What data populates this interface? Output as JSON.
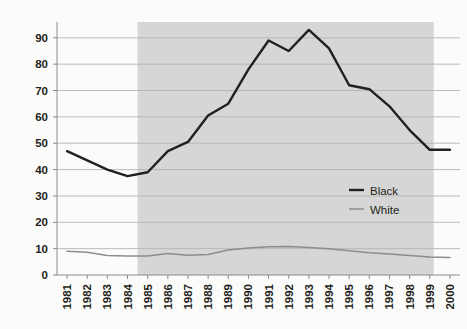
{
  "chart_data": {
    "type": "line",
    "title": "",
    "subtitle": "",
    "xlabel": "",
    "ylabel": "",
    "x": [
      1981,
      1982,
      1983,
      1984,
      1985,
      1986,
      1987,
      1988,
      1989,
      1990,
      1991,
      1992,
      1993,
      1994,
      1995,
      1996,
      1997,
      1998,
      1999,
      2000
    ],
    "categories": [
      "1981",
      "1982",
      "1983",
      "1984",
      "1985",
      "1986",
      "1987",
      "1988",
      "1989",
      "1990",
      "1991",
      "1992",
      "1993",
      "1994",
      "1995",
      "1996",
      "1997",
      "1998",
      "1999",
      "2000"
    ],
    "series": [
      {
        "name": "Black",
        "color": "#231f20",
        "values": [
          47,
          43.5,
          40,
          37.5,
          39,
          47,
          50.5,
          60.5,
          65,
          78,
          89,
          85,
          93,
          86,
          72,
          70.5,
          64,
          55,
          47.5,
          47.5
        ]
      },
      {
        "name": "White",
        "color": "#8c8c8c",
        "values": [
          9,
          8.6,
          7.4,
          7.2,
          7.2,
          8.2,
          7.5,
          7.8,
          9.5,
          10.2,
          10.7,
          10.8,
          10.4,
          10,
          9.2,
          8.4,
          8,
          7.4,
          6.8,
          6.6
        ]
      }
    ],
    "ylim": [
      0,
      96
    ],
    "yticks": [
      0,
      10,
      20,
      30,
      40,
      50,
      60,
      70,
      80,
      90
    ],
    "ytick_labels": [
      "0",
      "10",
      "20",
      "30",
      "40",
      "50",
      "60",
      "70",
      "80",
      "90"
    ],
    "grid": true,
    "grid_color": "#b3b3b3",
    "legend_position": "center-right",
    "legend": [
      "Black",
      "White"
    ],
    "background_color": "#fbfbfa",
    "shaded_band": {
      "label": "",
      "from": "1984.5",
      "to": "1999.2",
      "color": "#d6d6d6"
    },
    "axis_color": "#8c8c8c"
  },
  "legend": {
    "items": [
      {
        "label": "Black",
        "color": "#231f20"
      },
      {
        "label": "White",
        "color": "#8c8c8c"
      }
    ]
  }
}
